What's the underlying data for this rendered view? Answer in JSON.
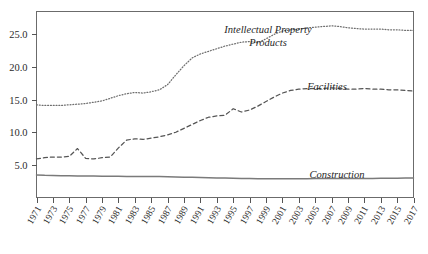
{
  "chart_data": {
    "type": "line",
    "title": "",
    "subtitle": "",
    "xlabel": "",
    "ylabel": "",
    "grid": false,
    "legend_position": "inline-annotations",
    "xlim": [
      1971,
      2017
    ],
    "ylim": [
      0.0,
      28.5
    ],
    "y_ticks": [
      "5.0",
      "10.0",
      "15.0",
      "20.0",
      "25.0"
    ],
    "y_tick_values": [
      5.0,
      10.0,
      15.0,
      20.0,
      25.0
    ],
    "x_tick_labels": [
      "1971",
      "1973",
      "1975",
      "1977",
      "1979",
      "1981",
      "1983",
      "1985",
      "1987",
      "1989",
      "1991",
      "1993",
      "1995",
      "1997",
      "1999",
      "2001",
      "2003",
      "2005",
      "2007",
      "2009",
      "2011",
      "2013",
      "2015",
      "2017"
    ],
    "x": [
      1971,
      1972,
      1973,
      1974,
      1975,
      1976,
      1977,
      1978,
      1979,
      1980,
      1981,
      1982,
      1983,
      1984,
      1985,
      1986,
      1987,
      1988,
      1989,
      1990,
      1991,
      1992,
      1993,
      1994,
      1995,
      1996,
      1997,
      1998,
      1999,
      2000,
      2001,
      2002,
      2003,
      2004,
      2005,
      2006,
      2007,
      2008,
      2009,
      2010,
      2011,
      2012,
      2013,
      2014,
      2015,
      2016,
      2017
    ],
    "series": [
      {
        "name": "Intellectual Property Products",
        "label": "Intellectual Property",
        "label_line2": "Products",
        "style": "dotted",
        "color": "#6e6e6e",
        "values": [
          14.2,
          14.1,
          14.1,
          14.1,
          14.2,
          14.3,
          14.4,
          14.6,
          14.8,
          15.2,
          15.6,
          15.9,
          16.1,
          16.0,
          16.2,
          16.5,
          17.3,
          18.8,
          20.2,
          21.4,
          22.0,
          22.4,
          22.8,
          23.2,
          23.5,
          23.8,
          23.9,
          23.7,
          24.3,
          25.0,
          25.5,
          25.7,
          25.8,
          26.0,
          26.1,
          26.2,
          26.3,
          26.2,
          26.0,
          25.9,
          25.8,
          25.8,
          25.8,
          25.7,
          25.7,
          25.6,
          25.6
        ]
      },
      {
        "name": "Facilities",
        "label": "Facilities",
        "style": "dashed",
        "color": "#555555",
        "values": [
          5.9,
          6.1,
          6.2,
          6.2,
          6.3,
          7.5,
          6.0,
          5.9,
          6.1,
          6.2,
          7.6,
          8.8,
          9.0,
          8.9,
          9.1,
          9.3,
          9.6,
          10.0,
          10.6,
          11.2,
          11.8,
          12.3,
          12.5,
          12.6,
          13.6,
          13.1,
          13.4,
          14.0,
          14.7,
          15.4,
          16.0,
          16.4,
          16.6,
          16.7,
          16.7,
          16.7,
          16.8,
          16.7,
          16.6,
          16.6,
          16.7,
          16.6,
          16.6,
          16.5,
          16.5,
          16.4,
          16.3
        ]
      },
      {
        "name": "Construction",
        "label": "Construction",
        "style": "solid",
        "color": "#7a7a7a",
        "values": [
          3.45,
          3.4,
          3.38,
          3.35,
          3.32,
          3.3,
          3.3,
          3.28,
          3.26,
          3.25,
          3.24,
          3.22,
          3.22,
          3.22,
          3.23,
          3.2,
          3.18,
          3.15,
          3.12,
          3.1,
          3.06,
          3.02,
          3.0,
          2.98,
          2.95,
          2.92,
          2.9,
          2.88,
          2.86,
          2.86,
          2.87,
          2.88,
          2.88,
          2.89,
          2.9,
          2.9,
          2.9,
          2.9,
          2.91,
          2.91,
          2.92,
          2.93,
          2.94,
          2.95,
          2.96,
          2.97,
          2.98
        ]
      }
    ]
  },
  "annotations": {
    "ipp_label_line1": "Intellectual Property",
    "ipp_label_line2": "Products",
    "facilities_label": "Facilities",
    "construction_label": "Construction"
  },
  "colors": {
    "background": "#ffffff",
    "frame": "#6b6b6b",
    "text": "#2b2b2b",
    "ipp": "#6e6e6e",
    "facilities": "#555555",
    "construction": "#7a7a7a"
  }
}
